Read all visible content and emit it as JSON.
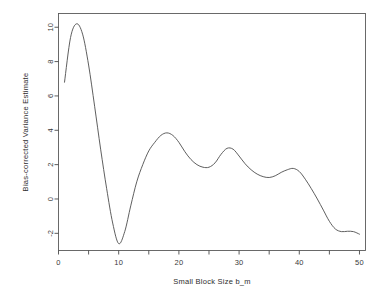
{
  "chart_data": {
    "type": "line",
    "title": "",
    "xlabel": "Small Block Size b_m",
    "ylabel": "Bias-corrected Variance Estimate",
    "xlim": [
      0,
      51
    ],
    "ylim": [
      -3.0,
      10.8
    ],
    "grid": false,
    "legend": null,
    "xticks": [
      0,
      10,
      20,
      30,
      40,
      50
    ],
    "xtick_labels": [
      "0",
      "10",
      "20",
      "30",
      "40",
      "50"
    ],
    "yticks": [
      -2,
      0,
      2,
      4,
      6,
      8,
      10
    ],
    "ytick_labels": [
      "-2",
      "0",
      "2",
      "4",
      "6",
      "8",
      "10"
    ],
    "series": [
      {
        "name": "Bias-corrected Variance Estimate",
        "color": "#4d4d4d",
        "x": [
          1,
          2,
          3,
          4,
          5,
          6,
          7,
          8,
          9,
          10,
          11,
          12,
          13,
          14,
          15,
          16,
          17,
          18,
          19,
          20,
          21,
          22,
          23,
          24,
          25,
          26,
          27,
          28,
          29,
          30,
          31,
          32,
          33,
          34,
          35,
          36,
          37,
          38,
          39,
          40,
          41,
          42,
          43,
          44,
          45,
          46,
          47,
          48,
          49,
          50
        ],
        "y": [
          6.8,
          9.4,
          10.2,
          9.6,
          7.8,
          5.4,
          2.9,
          0.6,
          -1.4,
          -2.6,
          -1.9,
          -0.4,
          1.0,
          2.0,
          2.8,
          3.3,
          3.7,
          3.85,
          3.7,
          3.3,
          2.75,
          2.3,
          2.0,
          1.85,
          1.85,
          2.1,
          2.6,
          2.95,
          2.9,
          2.5,
          2.05,
          1.7,
          1.45,
          1.3,
          1.25,
          1.35,
          1.55,
          1.7,
          1.78,
          1.6,
          1.15,
          0.6,
          0.0,
          -0.65,
          -1.3,
          -1.75,
          -1.9,
          -1.88,
          -1.9,
          -2.05
        ]
      }
    ]
  },
  "axes": {
    "x_label_text": "Small Block Size b_m",
    "y_label_text": "Bias-corrected Variance Estimate"
  }
}
